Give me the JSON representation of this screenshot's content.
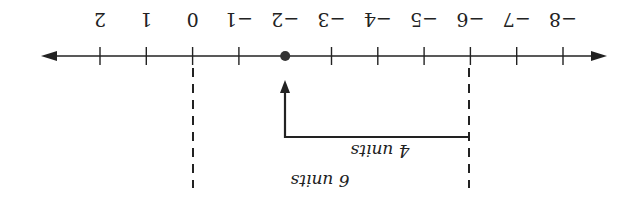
{
  "diagram": {
    "type": "number-line",
    "orientation_rotation_deg": 180,
    "colors": {
      "line": "#222222",
      "background": "#ffffff"
    },
    "axis": {
      "min": -8,
      "max": 2,
      "ticks": [
        {
          "value": -8,
          "label": "−8"
        },
        {
          "value": -7,
          "label": "−7"
        },
        {
          "value": -6,
          "label": "−6"
        },
        {
          "value": -5,
          "label": "−5"
        },
        {
          "value": -4,
          "label": "−4"
        },
        {
          "value": -3,
          "label": "−3"
        },
        {
          "value": -2,
          "label": "−2"
        },
        {
          "value": -1,
          "label": "−1"
        },
        {
          "value": 0,
          "label": "0"
        },
        {
          "value": 1,
          "label": "1"
        },
        {
          "value": 2,
          "label": "2"
        }
      ]
    },
    "point": {
      "value": -2
    },
    "dashed_markers": [
      {
        "value": 0
      },
      {
        "value": -6
      }
    ],
    "arrow": {
      "from": -6,
      "to": -2
    },
    "annotations": {
      "four_units": "4 units",
      "six_units": "6 units"
    }
  }
}
